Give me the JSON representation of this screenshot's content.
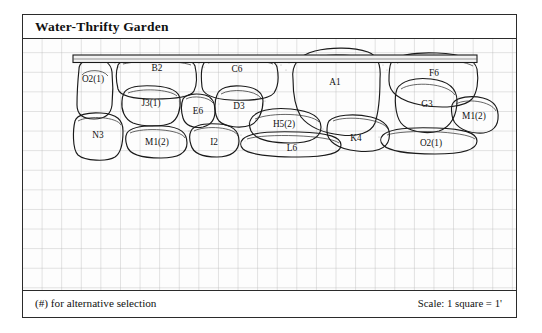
{
  "plan": {
    "title": "Water-Thrifty Garden",
    "footnote": "(#) for alternative selection",
    "scale_note": "Scale: 1 square = 1'",
    "colors": {
      "ink": "#1a1a1a",
      "grid": "#969696",
      "paper": "#fdfdfd",
      "cap_fill": "#f2f2f2"
    },
    "grid": {
      "square_px": 19.6,
      "square_meaning": "1 foot"
    }
  },
  "wall": {
    "cap": {
      "label": "wall-cap",
      "present": true
    },
    "stones": [
      {
        "id": "O2a",
        "label": "O2(1)",
        "lx": 70,
        "ly": 40
      },
      {
        "id": "B2",
        "label": "B2",
        "lx": 135,
        "ly": 28
      },
      {
        "id": "C6",
        "label": "C6",
        "lx": 213,
        "ly": 30
      },
      {
        "id": "A1",
        "label": "A1",
        "lx": 310,
        "ly": 42
      },
      {
        "id": "F6",
        "label": "F6",
        "lx": 423,
        "ly": 26
      },
      {
        "id": "J3",
        "label": "J3(1)",
        "lx": 120,
        "ly": 62
      },
      {
        "id": "E6",
        "label": "E6",
        "lx": 170,
        "ly": 73
      },
      {
        "id": "D3",
        "label": "D3",
        "lx": 213,
        "ly": 70
      },
      {
        "id": "G3",
        "label": "G3",
        "lx": 406,
        "ly": 60
      },
      {
        "id": "M1b",
        "label": "M1(2)",
        "lx": 452,
        "ly": 75
      },
      {
        "id": "H5",
        "label": "H5(2)",
        "lx": 255,
        "ly": 86
      },
      {
        "id": "N3",
        "label": "N3",
        "lx": 74,
        "ly": 92
      },
      {
        "id": "M1a",
        "label": "M1(2)",
        "lx": 133,
        "ly": 104
      },
      {
        "id": "I2",
        "label": "I2",
        "lx": 190,
        "ly": 104
      },
      {
        "id": "L6",
        "label": "L6",
        "lx": 268,
        "ly": 110
      },
      {
        "id": "K4",
        "label": "K4",
        "lx": 334,
        "ly": 99
      },
      {
        "id": "O2b",
        "label": "O2(1)",
        "lx": 406,
        "ly": 105
      }
    ]
  }
}
